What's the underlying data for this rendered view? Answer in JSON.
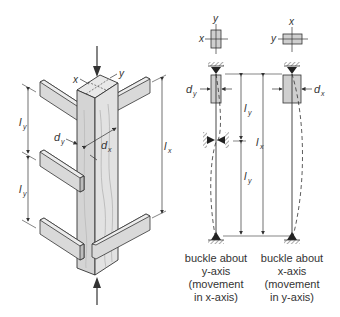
{
  "figure": {
    "left_view": {
      "description": "isometric timber column braced by horizontal members",
      "axis_labels": {
        "x": "x",
        "y": "y"
      },
      "dimension_labels": {
        "ly_upper": {
          "main": "l",
          "sub": "y"
        },
        "ly_lower": {
          "main": "l",
          "sub": "y"
        },
        "lx": {
          "main": "l",
          "sub": "x"
        },
        "dy": {
          "main": "d",
          "sub": "y"
        },
        "dx": {
          "main": "d",
          "sub": "x"
        }
      }
    },
    "middle_view": {
      "section_axes": {
        "vertical": "y",
        "horizontal": "x"
      },
      "depth_label": {
        "main": "d",
        "sub": "y"
      },
      "length_upper": {
        "main": "l",
        "sub": "y"
      },
      "length_lower": {
        "main": "l",
        "sub": "y"
      },
      "length_total": {
        "main": "l",
        "sub": "x"
      },
      "caption": [
        "buckle about",
        "y-axis",
        "(movement",
        "in x-axis)"
      ]
    },
    "right_view": {
      "section_axes": {
        "vertical": "x",
        "horizontal": "y"
      },
      "depth_label": {
        "main": "d",
        "sub": "x"
      },
      "caption": [
        "buckle about",
        "x-axis",
        "(movement",
        "in y-axis)"
      ]
    },
    "colors": {
      "wood_light": "#e2e2e2",
      "wood_mid": "#c9c9c9",
      "wood_dark": "#a8a8a8",
      "line": "#333333",
      "section_fill": "#cfcfcf"
    }
  }
}
